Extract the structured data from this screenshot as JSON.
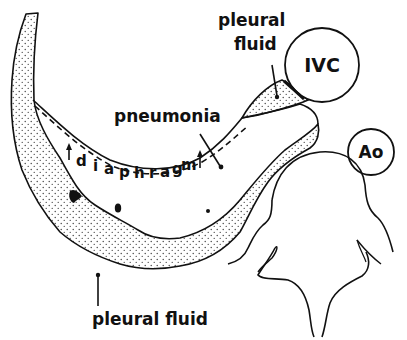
{
  "diagram": {
    "type": "anatomical-cross-section",
    "labels": {
      "pleural_fluid_top_line1": "pleural",
      "pleural_fluid_top_line2": "fluid",
      "ivc": "IVC",
      "pneumonia": "pneumonia",
      "diaphragm_letters": [
        "d",
        "i",
        "a",
        "p",
        "h",
        "r",
        "a",
        "g",
        "m"
      ],
      "aorta": "Ao",
      "pleural_fluid_bottom": "pleural fluid"
    },
    "structures": [
      "pleural-fluid-crescent",
      "lung-consolidation",
      "diaphragm-dashed-line",
      "inferior-vena-cava",
      "aorta",
      "vertebra"
    ],
    "colors": {
      "ink": "#111111",
      "background": "#ffffff",
      "stipple": "#333333"
    }
  }
}
